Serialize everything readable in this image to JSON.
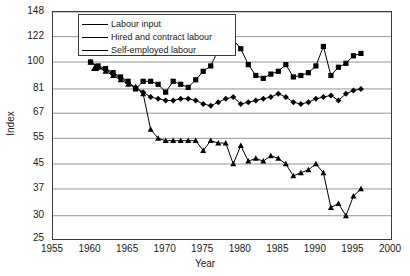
{
  "chart_data": {
    "type": "line",
    "title": "",
    "xlabel": "Year",
    "ylabel": "Index",
    "xlim": [
      1955,
      2000
    ],
    "ylim": [
      25,
      148
    ],
    "yscale": "log",
    "grid": true,
    "legend_position": "top-left-inside",
    "xticks": [
      1955,
      1960,
      1965,
      1970,
      1975,
      1980,
      1985,
      1990,
      1995,
      2000
    ],
    "yticks": [
      25,
      30,
      37,
      45,
      55,
      67,
      81,
      100,
      122,
      148
    ],
    "x": [
      1960,
      1961,
      1962,
      1963,
      1964,
      1965,
      1966,
      1967,
      1968,
      1969,
      1970,
      1971,
      1972,
      1973,
      1974,
      1975,
      1976,
      1977,
      1978,
      1979,
      1980,
      1981,
      1982,
      1983,
      1984,
      1985,
      1986,
      1987,
      1988,
      1989,
      1990,
      1991,
      1992,
      1993,
      1994,
      1995,
      1996
    ],
    "series": [
      {
        "name": "Labour input",
        "marker": "diamond",
        "values": [
          100,
          96,
          94,
          91,
          88,
          85,
          82,
          79,
          76,
          75,
          74,
          74,
          75,
          75,
          74,
          72,
          71,
          73,
          75,
          76,
          72,
          73,
          74,
          75,
          76,
          78,
          76,
          73,
          72,
          73,
          75,
          76,
          77,
          74,
          78,
          80,
          81
        ]
      },
      {
        "name": "Hired and contract labour",
        "marker": "square",
        "values": [
          100,
          97,
          95,
          92,
          89,
          86,
          81,
          86,
          86,
          84,
          79,
          86,
          84,
          82,
          87,
          93,
          97,
          110,
          121,
          119,
          111,
          98,
          90,
          88,
          91,
          93,
          98,
          89,
          90,
          92,
          97,
          113,
          90,
          96,
          99,
          105,
          107
        ]
      },
      {
        "name": "Self-employed labour",
        "marker": "triangle",
        "values": [
          100,
          96,
          93,
          90,
          87,
          84,
          82,
          78,
          59,
          55,
          54,
          54,
          54,
          54,
          54,
          50,
          54,
          53,
          53,
          45,
          52,
          46,
          47,
          46,
          48,
          47,
          45,
          41,
          42,
          43,
          45,
          42,
          32,
          33,
          30,
          35,
          37
        ]
      }
    ]
  },
  "legend": {
    "items": [
      {
        "label": "Labour input",
        "marker": "diamond"
      },
      {
        "label": "Hired and contract labour",
        "marker": "square"
      },
      {
        "label": "Self-employed labour",
        "marker": "triangle"
      }
    ]
  },
  "axes": {
    "y_title": "Index",
    "x_title": "Year"
  }
}
